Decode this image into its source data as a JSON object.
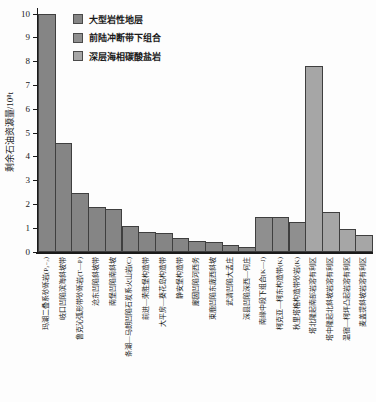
{
  "chart_data": {
    "type": "bar",
    "title": "",
    "ylabel": "剩余石油资源量/10⁸t",
    "ylim": [
      0,
      10
    ],
    "ytick_step": 1,
    "grid": false,
    "legend_position": "top-inside",
    "categories": [
      "玛湖二叠系砂砾岩(P₂₋₃)",
      "岐口凹陷滨海斜坡带",
      "鲁克沁弧形带砂砾岩(T—P)",
      "沧东凹陷斜坡带",
      "南堡凹陷南斜坡",
      "条湖—马朗凹陷石炭系火山岩(C)",
      "前进—荣胜堡构造带",
      "大平房—葵花岛构造带",
      "静安堡构造带",
      "廊固凹陷河西务",
      "束鹿凹陷东庞西斜坡",
      "武清凹陷大孟庄",
      "深县凹陷深西—何庄",
      "南缘中段下组合(K—J)",
      "柯克亚—柯东构造带(K)",
      "秋里塔格构造带砂岩(K)",
      "塔北隆起南部岩溶有利区",
      "塔中隆起北斜坡岩溶有利区",
      "温宿—柯坪凸起岩溶有利区",
      "麦盖提斜坡岩溶有利区"
    ],
    "values": [
      10.0,
      4.6,
      2.5,
      1.9,
      1.8,
      1.1,
      0.85,
      0.8,
      0.6,
      0.45,
      0.4,
      0.3,
      0.2,
      1.45,
      1.45,
      1.25,
      7.8,
      1.7,
      0.95,
      0.7
    ],
    "group_index": [
      0,
      0,
      0,
      0,
      0,
      0,
      0,
      0,
      0,
      0,
      0,
      0,
      0,
      1,
      1,
      1,
      2,
      2,
      2,
      2
    ],
    "legend": [
      {
        "label": "大型岩性地层",
        "color": "#858585"
      },
      {
        "label": "前陆冲断带下组合",
        "color": "#8f8f8f"
      },
      {
        "label": "深层海相碳酸盐岩",
        "color": "#a6a6a6"
      }
    ],
    "bar_border_color": "#3f3f3f",
    "axis_color": "#1a1a1a"
  }
}
